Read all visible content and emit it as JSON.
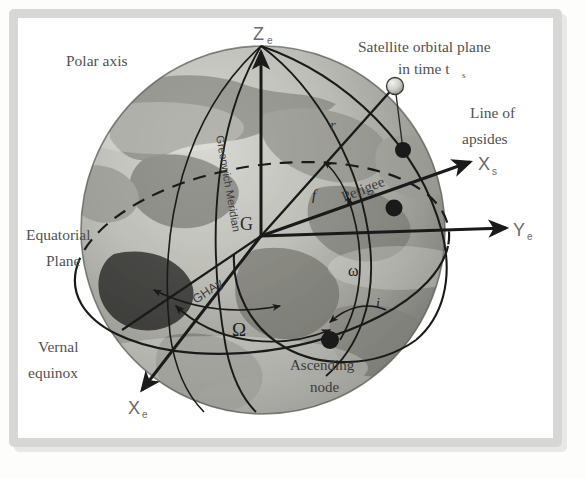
{
  "figure": {
    "type": "astronomy-orbital-elements-diagram",
    "background_object": "earth-globe-grayscale-photo"
  },
  "labels": {
    "polar_axis": "Polar axis",
    "satellite_plane_line1": "Satellite orbital plane",
    "satellite_plane_line2": "in time t",
    "satellite_plane_sub": "s",
    "line_of_apsides_line1": "Line of",
    "line_of_apsides_line2": "apsides",
    "equatorial_plane_line1": "Equatorial",
    "equatorial_plane_line2": "Plane",
    "vernal_equinox_line1": "Vernal",
    "vernal_equinox_line2": "equinox",
    "ascending_node_line1": "Ascending",
    "ascending_node_line2": "node",
    "perigee": "Perigee",
    "greenwich_meridian": "Greenwich Meridian",
    "gha_aries": "GHAγ",
    "center": "G",
    "radius": "r",
    "true_anomaly": "f",
    "arg_perigee": "ω",
    "raan": "Ω",
    "inclination": "i"
  },
  "axes": [
    {
      "name": "z-earth",
      "letter": "Z",
      "sub": "e"
    },
    {
      "name": "y-earth",
      "letter": "Y",
      "sub": "e"
    },
    {
      "name": "x-earth",
      "letter": "X",
      "sub": "e"
    },
    {
      "name": "x-satellite",
      "letter": "X",
      "sub": "s"
    }
  ],
  "markers": [
    {
      "name": "satellite",
      "style": "open-sphere"
    },
    {
      "name": "orbit-point-upper",
      "style": "filled-dot"
    },
    {
      "name": "perigee-point",
      "style": "filled-dot"
    },
    {
      "name": "ascending-node-point",
      "style": "filled-dot"
    }
  ],
  "colors": {
    "frame": "#d7d7d5",
    "page": "#ffffff",
    "line": "#1a1a1a",
    "label_text": "#4d4d4d",
    "axis_text": "#6a6a6a",
    "globe_light": "#c9c9c4",
    "globe_dark": "#6f6f6a"
  }
}
